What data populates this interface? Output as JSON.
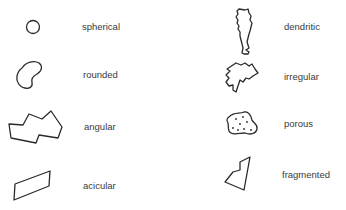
{
  "shapes": [
    {
      "id": "spherical",
      "label": "spherical",
      "column": "left",
      "row": 1
    },
    {
      "id": "rounded",
      "label": "rounded",
      "column": "left",
      "row": 2
    },
    {
      "id": "angular",
      "label": "angular",
      "column": "left",
      "row": 3
    },
    {
      "id": "acicular",
      "label": "acicular",
      "column": "left",
      "row": 4
    },
    {
      "id": "dendritic",
      "label": "dendritic",
      "column": "right",
      "row": 1
    },
    {
      "id": "irregular",
      "label": "irregular",
      "column": "right",
      "row": 2
    },
    {
      "id": "porous",
      "label": "porous",
      "column": "right",
      "row": 3
    },
    {
      "id": "fragmented",
      "label": "fragmented",
      "column": "right",
      "row": 4
    }
  ],
  "colors": {
    "stroke": "#2a2a2a",
    "text": "#3a3a3a",
    "background": "#ffffff"
  }
}
